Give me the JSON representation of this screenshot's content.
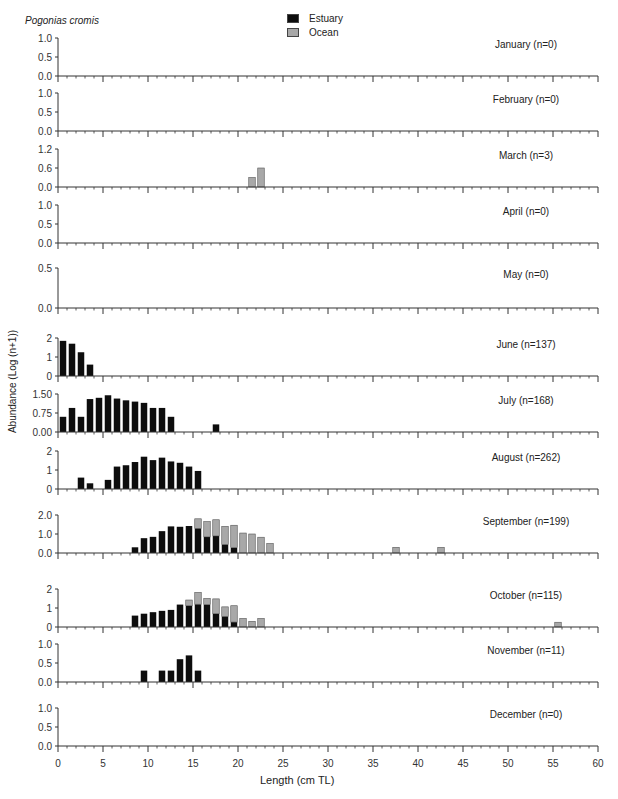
{
  "species": "Pogonias cromis",
  "legend": [
    {
      "label": "Estuary",
      "color": "#0d0d0d"
    },
    {
      "label": "Ocean",
      "color": "#a8a8a8"
    }
  ],
  "axes": {
    "ylabel": "Abundance (Log (n+1))",
    "xlabel": "Length (cm TL)",
    "xticks": [
      "0",
      "5",
      "10",
      "15",
      "20",
      "25",
      "30",
      "35",
      "40",
      "45",
      "50",
      "55",
      "60"
    ]
  },
  "chart_data": {
    "type": "bar",
    "stacked": true,
    "title": "Pogonias cromis",
    "xlabel": "Length (cm TL)",
    "ylabel": "Abundance (Log (n+1))",
    "xlim": [
      0,
      60
    ],
    "legend": [
      "Estuary",
      "Ocean"
    ],
    "panels": [
      {
        "month": "January (n=0)",
        "yticks": [
          "0.0",
          "0.5",
          "1.0"
        ],
        "ylim": [
          0,
          1.0
        ],
        "estuary": [],
        "ocean": []
      },
      {
        "month": "February (n=0)",
        "yticks": [
          "0.0",
          "0.5",
          "1.0"
        ],
        "ylim": [
          0,
          1.0
        ],
        "estuary": [],
        "ocean": []
      },
      {
        "month": "March (n=3)",
        "yticks": [
          "0.0",
          "0.6",
          "1.2"
        ],
        "ylim": [
          0,
          1.2
        ],
        "estuary": [],
        "ocean": [
          [
            22,
            0.3
          ],
          [
            23,
            0.6
          ]
        ]
      },
      {
        "month": "April (n=0)",
        "yticks": [
          "0.0",
          "0.5",
          "1.0"
        ],
        "ylim": [
          0,
          1.0
        ],
        "estuary": [],
        "ocean": []
      },
      {
        "month": "May (n=0)",
        "yticks": [
          "0.0",
          "0.5"
        ],
        "ylim": [
          0,
          0.5
        ],
        "estuary": [],
        "ocean": []
      },
      {
        "month": "June (n=137)",
        "yticks": [
          "0",
          "1",
          "2"
        ],
        "ylim": [
          0,
          2
        ],
        "estuary": [
          [
            1,
            1.85
          ],
          [
            2,
            1.7
          ],
          [
            3,
            1.25
          ],
          [
            4,
            0.6
          ]
        ],
        "ocean": []
      },
      {
        "month": "July (n=168)",
        "yticks": [
          "0.00",
          "0.75",
          "1.50"
        ],
        "ylim": [
          0,
          1.5
        ],
        "estuary": [
          [
            1,
            0.6
          ],
          [
            2,
            0.95
          ],
          [
            3,
            0.6
          ],
          [
            4,
            1.3
          ],
          [
            5,
            1.35
          ],
          [
            6,
            1.45
          ],
          [
            7,
            1.32
          ],
          [
            8,
            1.25
          ],
          [
            9,
            1.2
          ],
          [
            10,
            1.15
          ],
          [
            11,
            0.95
          ],
          [
            12,
            0.95
          ],
          [
            13,
            0.6
          ],
          [
            18,
            0.3
          ]
        ],
        "ocean": []
      },
      {
        "month": "August (n=262)",
        "yticks": [
          "0",
          "1",
          "2"
        ],
        "ylim": [
          0,
          2
        ],
        "estuary": [
          [
            3,
            0.6
          ],
          [
            4,
            0.3
          ],
          [
            6,
            0.48
          ],
          [
            7,
            1.18
          ],
          [
            8,
            1.25
          ],
          [
            9,
            1.42
          ],
          [
            10,
            1.7
          ],
          [
            11,
            1.52
          ],
          [
            12,
            1.65
          ],
          [
            13,
            1.45
          ],
          [
            14,
            1.38
          ],
          [
            15,
            1.18
          ],
          [
            16,
            0.95
          ]
        ],
        "ocean": []
      },
      {
        "month": "September (n=199)",
        "yticks": [
          "0.0",
          "1.0",
          "2.0"
        ],
        "ylim": [
          0,
          2.0
        ],
        "estuary": [
          [
            9,
            0.3
          ],
          [
            10,
            0.78
          ],
          [
            11,
            0.85
          ],
          [
            12,
            1.15
          ],
          [
            13,
            1.4
          ],
          [
            14,
            1.38
          ],
          [
            15,
            1.42
          ],
          [
            16,
            1.3
          ],
          [
            17,
            0.85
          ],
          [
            18,
            0.9
          ],
          [
            19,
            0.45
          ],
          [
            20,
            0.28
          ]
        ],
        "ocean": [
          [
            16,
            0.5
          ],
          [
            17,
            0.8
          ],
          [
            18,
            0.85
          ],
          [
            19,
            0.95
          ],
          [
            20,
            1.18
          ],
          [
            21,
            1.05
          ],
          [
            22,
            1.0
          ],
          [
            23,
            0.83
          ],
          [
            24,
            0.5
          ],
          [
            38,
            0.3
          ],
          [
            43,
            0.3
          ]
        ]
      },
      {
        "month": "October (n=115)",
        "yticks": [
          "0",
          "1",
          "2"
        ],
        "ylim": [
          0,
          2
        ],
        "estuary": [
          [
            9,
            0.6
          ],
          [
            10,
            0.7
          ],
          [
            11,
            0.78
          ],
          [
            12,
            0.85
          ],
          [
            13,
            0.9
          ],
          [
            14,
            1.18
          ],
          [
            15,
            1.12
          ],
          [
            16,
            1.2
          ],
          [
            17,
            1.18
          ],
          [
            18,
            0.7
          ],
          [
            19,
            0.56
          ],
          [
            20,
            0.26
          ]
        ],
        "ocean": [
          [
            15,
            0.3
          ],
          [
            16,
            0.62
          ],
          [
            17,
            0.32
          ],
          [
            18,
            0.78
          ],
          [
            19,
            0.5
          ],
          [
            20,
            0.86
          ],
          [
            21,
            0.45
          ],
          [
            22,
            0.3
          ],
          [
            23,
            0.45
          ],
          [
            56,
            0.25
          ]
        ]
      },
      {
        "month": "November (n=11)",
        "yticks": [
          "0.0",
          "0.5",
          "1.0"
        ],
        "ylim": [
          0,
          1.0
        ],
        "estuary": [
          [
            10,
            0.3
          ],
          [
            12,
            0.3
          ],
          [
            13,
            0.3
          ],
          [
            14,
            0.6
          ],
          [
            15,
            0.7
          ],
          [
            16,
            0.3
          ]
        ],
        "ocean": []
      },
      {
        "month": "December (n=0)",
        "yticks": [
          "0.0",
          "0.5",
          "1.0"
        ],
        "ylim": [
          0,
          1.0
        ],
        "estuary": [],
        "ocean": []
      }
    ]
  }
}
